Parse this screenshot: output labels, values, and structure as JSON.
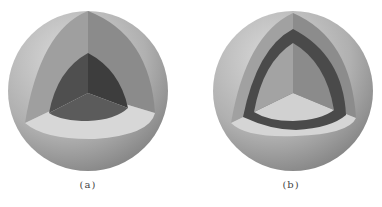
{
  "figures": [
    {
      "id": "a",
      "caption": "(a)",
      "description": "Sphere with octant cut away revealing a solid dark core",
      "layers": [
        "outer-shell",
        "core"
      ]
    },
    {
      "id": "b",
      "caption": "(b)",
      "description": "Sphere with octant cut away revealing a dark middle shell layer and lighter inner core",
      "layers": [
        "outer-shell",
        "middle-shell",
        "inner-core"
      ]
    }
  ],
  "colors": {
    "sphere_light": "#d2d2d2",
    "sphere_mid": "#a9a9a9",
    "sphere_dark": "#7a7a7a",
    "cut_left_face": "#9d9d9d",
    "cut_right_face": "#8a8a8a",
    "cut_bottom_face": "#d6d6d6",
    "core_dark_left": "#4f4f4f",
    "core_dark_right": "#3e3e3e",
    "core_dark_bottom": "#5c5c5c",
    "middle_shell": "#4a4a4a",
    "inner_left": "#a3a3a3",
    "inner_right": "#8c8c8c",
    "inner_bottom": "#d0d0d0"
  }
}
